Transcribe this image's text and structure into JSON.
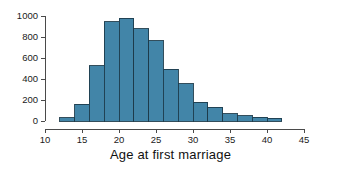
{
  "chart_data": {
    "type": "bar",
    "title": "",
    "xlabel": "Age at first marriage",
    "ylabel": "",
    "xlim": [
      10,
      45
    ],
    "ylim": [
      0,
      1000
    ],
    "grid": false,
    "legend": null,
    "bin_width": 2,
    "bar_color": "#4285a8",
    "bar_edge_color": "#1d3b4a",
    "axis_color": "#4a4a4a",
    "xticks": [
      10,
      15,
      20,
      25,
      30,
      35,
      40,
      45
    ],
    "xtick_labels": [
      "10",
      "15",
      "20",
      "25",
      "30",
      "35",
      "40",
      "45"
    ],
    "yticks": [
      0,
      200,
      400,
      600,
      800,
      1000
    ],
    "ytick_labels": [
      "0",
      "200",
      "400",
      "600",
      "800",
      "1000"
    ],
    "bins": [
      {
        "x0": 12,
        "x1": 14,
        "value": 30
      },
      {
        "x0": 14,
        "x1": 16,
        "value": 160
      },
      {
        "x0": 16,
        "x1": 18,
        "value": 525
      },
      {
        "x0": 18,
        "x1": 20,
        "value": 945
      },
      {
        "x0": 20,
        "x1": 22,
        "value": 980
      },
      {
        "x0": 22,
        "x1": 24,
        "value": 880
      },
      {
        "x0": 24,
        "x1": 26,
        "value": 765
      },
      {
        "x0": 26,
        "x1": 28,
        "value": 495
      },
      {
        "x0": 28,
        "x1": 30,
        "value": 355
      },
      {
        "x0": 30,
        "x1": 32,
        "value": 180
      },
      {
        "x0": 32,
        "x1": 34,
        "value": 130
      },
      {
        "x0": 34,
        "x1": 36,
        "value": 70
      },
      {
        "x0": 36,
        "x1": 38,
        "value": 48
      },
      {
        "x0": 38,
        "x1": 40,
        "value": 35
      },
      {
        "x0": 40,
        "x1": 42,
        "value": 25
      }
    ]
  }
}
